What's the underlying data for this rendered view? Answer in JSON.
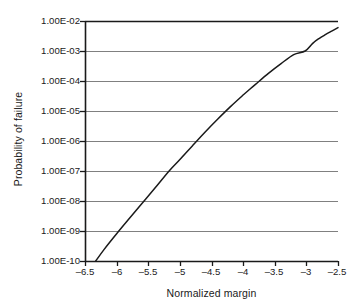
{
  "chart_data": {
    "type": "line",
    "title": "",
    "xlabel": "Normalized margin",
    "ylabel": "Probability of failure",
    "yscale": "log",
    "xscale": "linear",
    "xlim": [
      -6.5,
      -2.5
    ],
    "ylim": [
      1e-10,
      0.01
    ],
    "grid": "horizontal",
    "legend": "none",
    "x_ticks": [
      -6.5,
      -6,
      -5.5,
      -5,
      -4.5,
      -4,
      -3.5,
      -3,
      -2.5
    ],
    "x_tick_labels": [
      "–6.5",
      "–6",
      "–5.5",
      "–5",
      "–4.5",
      "–4",
      "–3.5",
      "–3",
      "–2.5"
    ],
    "y_ticks": [
      0.01,
      0.001,
      0.0001,
      1e-05,
      1e-06,
      1e-07,
      1e-08,
      1e-09,
      1e-10
    ],
    "y_tick_labels": [
      "1.00E-02",
      "1.00E-03",
      "1.00E-04",
      "1.00E-05",
      "1.00E-06",
      "1.00E-07",
      "1.00E-08",
      "1.00E-09",
      "1.00E-10"
    ],
    "series": [
      {
        "name": "Probability of failure",
        "color": "#1a1a1a",
        "x": [
          -6.33,
          -6.2,
          -6.0,
          -5.8,
          -5.6,
          -5.4,
          -5.17,
          -5.0,
          -4.8,
          -4.6,
          -4.4,
          -4.2,
          -4.0,
          -3.9,
          -3.8,
          -3.6,
          -3.4,
          -3.2,
          -3.02,
          -2.9,
          -2.8,
          -2.7,
          -2.6,
          -2.5
        ],
        "y": [
          1e-10,
          2.4e-10,
          8.1e-10,
          2.6e-09,
          8.2e-09,
          2.6e-08,
          1e-07,
          2.4e-07,
          7e-07,
          2e-06,
          5.4e-06,
          1.4e-05,
          3.4e-05,
          5.2e-05,
          7.9e-05,
          0.00018,
          0.00038,
          0.00076,
          0.001,
          0.0018,
          0.0026,
          0.0035,
          0.0046,
          0.006
        ]
      }
    ],
    "colors": {
      "axis": "#1a1a1a",
      "gridline": "#808080",
      "curve": "#1a1a1a",
      "background": "#ffffff"
    }
  },
  "axes": {
    "y_title": "Probability of failure",
    "x_title": "Normalized margin",
    "y_tick_labels": [
      "1.00E-02",
      "1.00E-03",
      "1.00E-04",
      "1.00E-05",
      "1.00E-06",
      "1.00E-07",
      "1.00E-08",
      "1.00E-09",
      "1.00E-10"
    ],
    "x_tick_labels": [
      "–6.5",
      "–6",
      "–5.5",
      "–5",
      "–4.5",
      "–4",
      "–3.5",
      "–3",
      "–2.5"
    ]
  }
}
